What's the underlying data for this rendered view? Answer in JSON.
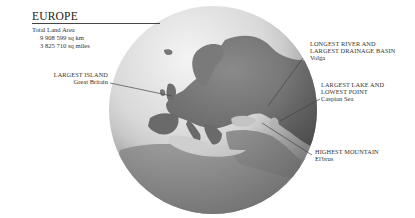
{
  "title": "EUROPE",
  "total_land_area": {
    "label": "Total Land Area",
    "km": "9 908 599 sq km",
    "miles": "3 825 710 sq miles"
  },
  "callouts": [
    {
      "id": "largest-island",
      "heading": "LARGEST ISLAND",
      "value": "Great Britain"
    },
    {
      "id": "longest-river",
      "heading_line1": "LONGEST RIVER AND",
      "heading_line2": "LARGEST DRAINAGE BASIN",
      "value": "Volga"
    },
    {
      "id": "largest-lake",
      "heading_line1": "LARGEST LAKE AND",
      "heading_line2": "LOWEST POINT",
      "value": "Caspian Sea"
    },
    {
      "id": "highest-mountain",
      "heading": "HIGHEST MOUNTAIN",
      "value": "El'brus"
    }
  ],
  "colors": {
    "ocean_light": "#e6e6e6",
    "ocean_dark": "#8a8a8a",
    "land": "#6e6e6e",
    "leader_line": "#444444"
  }
}
